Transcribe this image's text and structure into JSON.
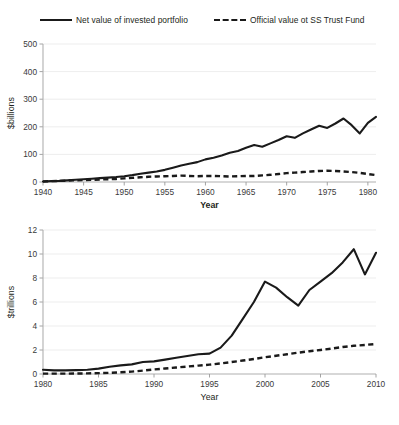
{
  "legend": {
    "items": [
      {
        "label": "Net value of invested portfolio",
        "style": "solid",
        "color": "#1a1a1a"
      },
      {
        "label": "Official value ot SS Trust Fund",
        "style": "dashed",
        "color": "#1a1a1a"
      }
    ]
  },
  "chart_data": [
    {
      "id": "top",
      "type": "line",
      "title": "",
      "xlabel": "Year",
      "ylabel": "$billions",
      "xlim": [
        1940,
        1981
      ],
      "ylim": [
        0,
        500
      ],
      "xticks": [
        1940,
        1945,
        1950,
        1955,
        1960,
        1965,
        1970,
        1975,
        1980
      ],
      "yticks": [
        0,
        100,
        200,
        300,
        400,
        500
      ],
      "grid": true,
      "legend_position": "top",
      "x": [
        1940,
        1941,
        1942,
        1943,
        1944,
        1945,
        1946,
        1947,
        1948,
        1949,
        1950,
        1951,
        1952,
        1953,
        1954,
        1955,
        1956,
        1957,
        1958,
        1959,
        1960,
        1961,
        1962,
        1963,
        1964,
        1965,
        1966,
        1967,
        1968,
        1969,
        1970,
        1971,
        1972,
        1973,
        1974,
        1975,
        1976,
        1977,
        1978,
        1979,
        1980,
        1981
      ],
      "series": [
        {
          "name": "Net value of invested portfolio",
          "style": "solid",
          "values": [
            2,
            3,
            4,
            6,
            8,
            10,
            12,
            14,
            16,
            18,
            21,
            25,
            30,
            34,
            38,
            44,
            52,
            60,
            66,
            72,
            82,
            88,
            96,
            106,
            112,
            124,
            134,
            128,
            140,
            152,
            166,
            160,
            176,
            190,
            204,
            196,
            212,
            230,
            206,
            176,
            214,
            236,
            222,
            238,
            262,
            250,
            268,
            290,
            276,
            262,
            300,
            316
          ]
        },
        {
          "name": "Official value ot SS Trust Fund",
          "style": "dashed",
          "values": [
            2,
            3,
            4,
            5,
            6,
            7,
            8,
            9,
            10,
            11,
            13,
            15,
            17,
            19,
            20,
            21,
            22,
            23,
            22,
            21,
            22,
            22,
            21,
            20,
            21,
            22,
            22,
            24,
            26,
            29,
            32,
            34,
            36,
            38,
            40,
            41,
            40,
            38,
            36,
            33,
            29,
            25
          ]
        }
      ]
    },
    {
      "id": "bottom",
      "type": "line",
      "title": "",
      "xlabel": "Year",
      "ylabel": "$trillions",
      "xlim": [
        1980,
        2010
      ],
      "ylim": [
        0,
        12
      ],
      "xticks": [
        1980,
        1985,
        1990,
        1995,
        2000,
        2005,
        2010
      ],
      "yticks": [
        0,
        2,
        4,
        6,
        8,
        10,
        12
      ],
      "grid": true,
      "legend_position": "top",
      "x": [
        1980,
        1981,
        1982,
        1983,
        1984,
        1985,
        1986,
        1987,
        1988,
        1989,
        1990,
        1991,
        1992,
        1993,
        1994,
        1995,
        1996,
        1997,
        1998,
        1999,
        2000,
        2001,
        2002,
        2003,
        2004,
        2005,
        2006,
        2007,
        2008,
        2009,
        2010
      ],
      "series": [
        {
          "name": "Net value of invested portfolio",
          "style": "solid",
          "values": [
            0.35,
            0.3,
            0.3,
            0.32,
            0.36,
            0.45,
            0.6,
            0.72,
            0.8,
            1.0,
            1.05,
            1.2,
            1.35,
            1.5,
            1.65,
            1.7,
            2.2,
            3.2,
            4.6,
            6.0,
            7.7,
            7.2,
            6.4,
            5.7,
            7.0,
            7.7,
            8.4,
            9.3,
            10.4,
            8.3,
            10.1
          ]
        },
        {
          "name": "Official value ot SS Trust Fund",
          "style": "dashed",
          "values": [
            0.03,
            0.03,
            0.03,
            0.04,
            0.05,
            0.07,
            0.1,
            0.14,
            0.2,
            0.28,
            0.38,
            0.46,
            0.54,
            0.62,
            0.7,
            0.78,
            0.88,
            1.0,
            1.12,
            1.25,
            1.4,
            1.52,
            1.65,
            1.78,
            1.9,
            2.0,
            2.12,
            2.25,
            2.35,
            2.42,
            2.5
          ]
        }
      ]
    }
  ]
}
